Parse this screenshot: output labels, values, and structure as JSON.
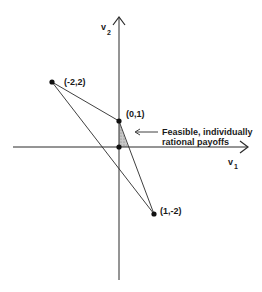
{
  "diagram": {
    "axes": {
      "x_label": "v",
      "x_subscript": "1",
      "y_label": "v",
      "y_subscript": "2"
    },
    "points": [
      {
        "label": "(-2,2)",
        "x": -2,
        "y": 2
      },
      {
        "label": "(0,1)",
        "x": 0,
        "y": 1
      },
      {
        "label": "(1,-2)",
        "x": 1,
        "y": -2
      },
      {
        "label": "",
        "x": 0,
        "y": 0
      }
    ],
    "triangle_vertices": [
      "(-2,2)",
      "(0,1)",
      "(1,-2)"
    ],
    "shaded_region": {
      "description": "Feasible, individually rational payoffs",
      "annotation_line1": "Feasible, individually",
      "annotation_line2": "rational payoffs",
      "fill_color": "#b0b0b0"
    },
    "colors": {
      "line": "#2a2a2a",
      "background": "#ffffff"
    }
  }
}
